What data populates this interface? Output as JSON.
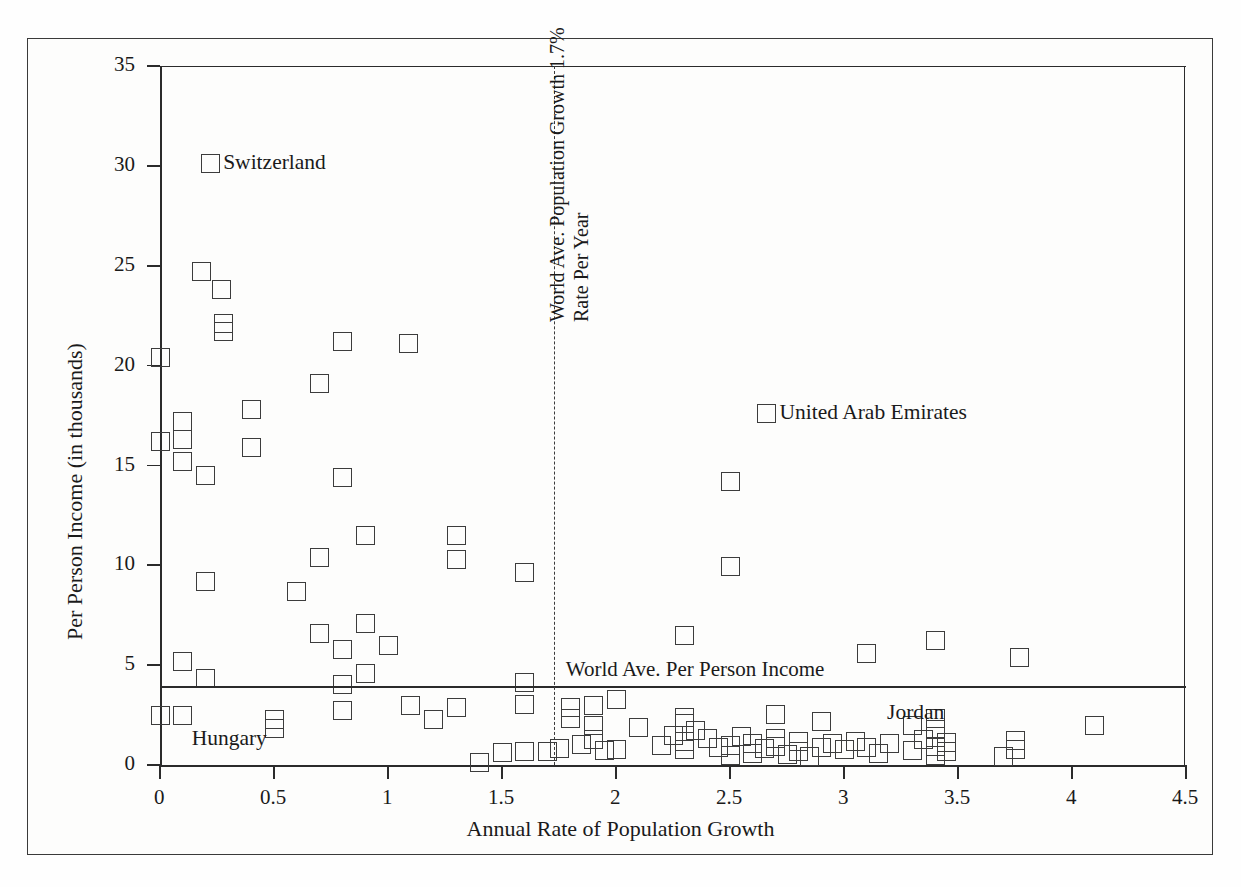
{
  "chart_data": {
    "type": "scatter",
    "title": "",
    "xlabel": "Annual Rate of Population Growth",
    "ylabel": "Per Person Income (in thousands)",
    "xlim": [
      0,
      4.5
    ],
    "ylim": [
      0,
      35
    ],
    "xticks": [
      "0",
      "0.5",
      "1",
      "1.5",
      "2",
      "2.5",
      "3",
      "3.5",
      "4",
      "4.5"
    ],
    "xtick_values": [
      0,
      0.5,
      1,
      1.5,
      2,
      2.5,
      3,
      3.5,
      4,
      4.5
    ],
    "yticks": [
      "0",
      "5",
      "10",
      "15",
      "20",
      "25",
      "30",
      "35"
    ],
    "ytick_values": [
      0,
      5,
      10,
      15,
      20,
      25,
      30,
      35
    ],
    "grid": false,
    "legend": "none",
    "marker_style": "open-square",
    "marker_color": "#3c3c3c",
    "reference_lines": [
      {
        "name": "world-average-per-person-income",
        "orientation": "horizontal",
        "value": 3.9,
        "style": "solid",
        "label": "World Ave. Per Person Income"
      },
      {
        "name": "world-average-population-growth",
        "orientation": "vertical",
        "value": 1.73,
        "style": "dashed",
        "label_line1": "World Ave. Population Growth 1.7%",
        "label_line2": "Rate Per Year"
      }
    ],
    "annotations": [
      {
        "text": "Switzerland",
        "x": 0.22,
        "y": 30.1,
        "marker": true
      },
      {
        "text": "United Arab Emirates",
        "x": 2.66,
        "y": 17.6,
        "marker": true
      },
      {
        "text": "Hungary",
        "x": 0.13,
        "y": 1.35,
        "marker": false
      },
      {
        "text": "Jordan",
        "x": 3.18,
        "y": 2.65,
        "marker": false
      }
    ],
    "points": [
      [
        0.22,
        30.1
      ],
      [
        0.0,
        20.4
      ],
      [
        0.18,
        24.7
      ],
      [
        0.27,
        23.8
      ],
      [
        0.28,
        22.1
      ],
      [
        0.28,
        21.7
      ],
      [
        0.8,
        21.2
      ],
      [
        1.09,
        21.1
      ],
      [
        0.7,
        19.1
      ],
      [
        0.4,
        17.8
      ],
      [
        0.1,
        17.2
      ],
      [
        2.66,
        17.6
      ],
      [
        0.0,
        16.2
      ],
      [
        0.1,
        16.3
      ],
      [
        0.4,
        15.9
      ],
      [
        0.1,
        15.2
      ],
      [
        0.2,
        14.5
      ],
      [
        0.8,
        14.4
      ],
      [
        2.5,
        14.2
      ],
      [
        0.9,
        11.5
      ],
      [
        1.3,
        11.5
      ],
      [
        0.7,
        10.4
      ],
      [
        1.3,
        10.3
      ],
      [
        2.5,
        9.95
      ],
      [
        1.6,
        9.65
      ],
      [
        0.2,
        9.2
      ],
      [
        0.6,
        8.7
      ],
      [
        0.9,
        7.1
      ],
      [
        0.7,
        6.6
      ],
      [
        2.3,
        6.5
      ],
      [
        3.4,
        6.25
      ],
      [
        1.0,
        6.0
      ],
      [
        0.8,
        5.8
      ],
      [
        3.1,
        5.6
      ],
      [
        3.77,
        5.4
      ],
      [
        0.1,
        5.2
      ],
      [
        0.9,
        4.6
      ],
      [
        0.2,
        4.35
      ],
      [
        0.8,
        4.05
      ],
      [
        1.6,
        4.15
      ],
      [
        1.6,
        3.05
      ],
      [
        1.1,
        3.0
      ],
      [
        1.3,
        2.9
      ],
      [
        0.0,
        2.5
      ],
      [
        0.1,
        2.5
      ],
      [
        0.5,
        2.3
      ],
      [
        0.5,
        1.85
      ],
      [
        0.8,
        2.75
      ],
      [
        1.2,
        2.3
      ],
      [
        1.9,
        3.0
      ],
      [
        2.0,
        3.3
      ],
      [
        1.8,
        2.9
      ],
      [
        2.9,
        2.2
      ],
      [
        2.7,
        2.55
      ],
      [
        2.3,
        2.4
      ],
      [
        2.3,
        2.1
      ],
      [
        1.9,
        2.0
      ],
      [
        1.8,
        2.35
      ],
      [
        2.1,
        1.9
      ],
      [
        3.3,
        2.0
      ],
      [
        4.1,
        2.0
      ],
      [
        3.4,
        2.35
      ],
      [
        3.4,
        1.8
      ],
      [
        1.4,
        0.15
      ],
      [
        1.5,
        0.65
      ],
      [
        1.6,
        0.7
      ],
      [
        1.7,
        0.7
      ],
      [
        1.75,
        0.85
      ],
      [
        1.85,
        1.05
      ],
      [
        1.9,
        1.3
      ],
      [
        1.95,
        0.75
      ],
      [
        2.0,
        0.8
      ],
      [
        2.2,
        1.0
      ],
      [
        2.25,
        1.5
      ],
      [
        2.3,
        1.2
      ],
      [
        2.3,
        0.8
      ],
      [
        2.35,
        1.75
      ],
      [
        2.4,
        1.35
      ],
      [
        2.45,
        0.9
      ],
      [
        2.5,
        0.5
      ],
      [
        2.5,
        1.0
      ],
      [
        2.55,
        1.45
      ],
      [
        2.6,
        0.6
      ],
      [
        2.6,
        1.1
      ],
      [
        2.65,
        0.85
      ],
      [
        2.7,
        1.35
      ],
      [
        2.7,
        0.95
      ],
      [
        2.75,
        0.55
      ],
      [
        2.8,
        1.2
      ],
      [
        2.8,
        0.7
      ],
      [
        2.85,
        0.45
      ],
      [
        2.9,
        0.9
      ],
      [
        2.95,
        1.1
      ],
      [
        3.0,
        0.8
      ],
      [
        3.05,
        1.2
      ],
      [
        3.1,
        0.9
      ],
      [
        3.15,
        0.6
      ],
      [
        3.2,
        1.1
      ],
      [
        3.3,
        0.75
      ],
      [
        3.35,
        1.3
      ],
      [
        3.4,
        0.95
      ],
      [
        3.4,
        0.5
      ],
      [
        3.45,
        1.15
      ],
      [
        3.45,
        0.7
      ],
      [
        3.7,
        0.45
      ],
      [
        3.75,
        1.25
      ],
      [
        3.75,
        0.8
      ]
    ]
  },
  "axes": {
    "x_title": "Annual Rate of Population Growth",
    "y_title": "Per Person Income (in thousands)"
  },
  "labels": {
    "switzerland": "Switzerland",
    "united_arab_emirates": "United Arab Emirates",
    "hungary": "Hungary",
    "jordan": "Jordan",
    "world_income": "World Ave. Per Person Income",
    "growth_line1": "World Ave. Population Growth 1.7%",
    "growth_line2": "Rate Per Year"
  }
}
